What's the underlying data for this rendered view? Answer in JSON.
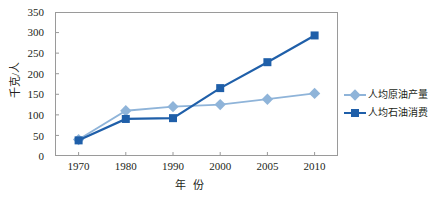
{
  "chart_data": {
    "type": "line",
    "title": "",
    "xlabel": "年 份",
    "ylabel": "千克/人",
    "categories": [
      "1970",
      "1980",
      "1990",
      "2000",
      "2005",
      "2010"
    ],
    "ylim": [
      0,
      350
    ],
    "yticks": [
      0,
      50,
      100,
      150,
      200,
      250,
      300,
      350
    ],
    "grid": false,
    "legend_position": "right",
    "series": [
      {
        "name": "人均原油产量",
        "marker": "diamond",
        "color": "#8FB4D9",
        "values": [
          40,
          110,
          120,
          125,
          138,
          152
        ]
      },
      {
        "name": "人均石油消费",
        "marker": "square",
        "color": "#1F5FA9",
        "values": [
          38,
          90,
          92,
          165,
          228,
          293
        ]
      }
    ]
  },
  "axes": {
    "y_title": "千克/人",
    "x_title": "年 份",
    "y_tick_labels": [
      "350",
      "300",
      "250",
      "200",
      "150",
      "100",
      "50",
      "0"
    ],
    "x_tick_labels": [
      "1970",
      "1980",
      "1990",
      "2000",
      "2005",
      "2010"
    ]
  },
  "legend": {
    "items": [
      {
        "label": "人均原油产量",
        "marker": "diamond-marker",
        "color": "#8FB4D9"
      },
      {
        "label": "人均石油消费",
        "marker": "square-marker",
        "color": "#1F5FA9"
      }
    ]
  },
  "style": {
    "frame_color": "#9A9A9A",
    "text_color": "#231F20",
    "background": "#FFFFFF"
  }
}
